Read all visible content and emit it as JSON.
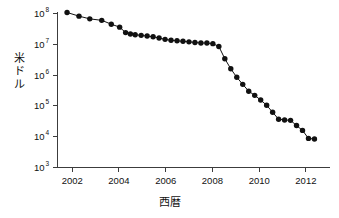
{
  "chart_data": {
    "type": "line",
    "title": "",
    "subtitle": "",
    "xlabel": "西暦",
    "ylabel": "米ドル",
    "xlabel_meaning": "Year (Western calendar)",
    "ylabel_meaning": "US Dollars",
    "yscale": "log",
    "xscale": "linear",
    "grid": false,
    "legend": null,
    "legend_position": "none",
    "marker": "filled-circle",
    "line_color": "#111111",
    "marker_color": "#111111",
    "axis_color": "#3c3c3c",
    "background_color": "#ffffff",
    "xlim": [
      2001.2,
      2012.6
    ],
    "ylim": [
      1000,
      150000000
    ],
    "xticks": [
      2002,
      2004,
      2006,
      2008,
      2010,
      2012
    ],
    "xticklabels": [
      "2002",
      "2004",
      "2006",
      "2008",
      "2010",
      "2012"
    ],
    "yticks": [
      1000,
      10000,
      100000,
      1000000,
      10000000,
      100000000
    ],
    "yticklabels": [
      "10³",
      "10⁴",
      "10⁵",
      "10⁶",
      "10⁷",
      "10⁸"
    ],
    "ytick_mantissa": "10",
    "ytick_exponents": [
      "3",
      "4",
      "5",
      "6",
      "7",
      "8"
    ],
    "x": [
      2001.6,
      2002.1,
      2002.55,
      2003.05,
      2003.45,
      2003.8,
      2004.05,
      2004.25,
      2004.45,
      2004.7,
      2004.95,
      2005.2,
      2005.45,
      2005.7,
      2005.95,
      2006.2,
      2006.45,
      2006.7,
      2006.95,
      2007.2,
      2007.45,
      2007.7,
      2007.95,
      2008.2,
      2008.45,
      2008.7,
      2008.95,
      2009.2,
      2009.45,
      2009.7,
      2009.95,
      2010.2,
      2010.45,
      2010.7,
      2010.95,
      2011.2,
      2011.45,
      2011.7,
      2011.95
    ],
    "y": [
      108000000,
      82000000,
      67000000,
      60000000,
      45000000,
      36000000,
      24000000,
      21500000,
      20500000,
      19500000,
      18500000,
      17500000,
      16000000,
      14500000,
      13500000,
      13000000,
      12500000,
      12000000,
      11500000,
      11000000,
      11000000,
      10500000,
      8500000,
      3400000,
      1600000,
      850000,
      500000,
      300000,
      220000,
      155000,
      105000,
      62000,
      37000,
      35000,
      34000,
      23000,
      16000,
      8800,
      8400
    ],
    "n_points": 39,
    "annotations": [],
    "description_en": "Semi-log plot of cost in US dollars declining from about 1.1×10⁸ in late 2001 to roughly 8×10³ by the end of 2011, with a plateau near 10⁷ between 2004 and 2008 followed by a steep drop after 2008."
  },
  "figure": {
    "axis_stroke_color": "#3c3c3c",
    "series_stroke_color": "#111111"
  }
}
